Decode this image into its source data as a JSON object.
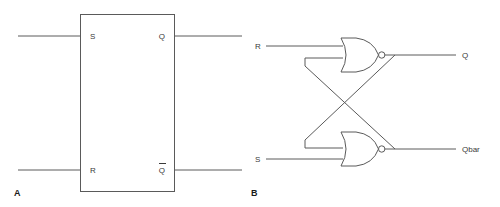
{
  "figure": {
    "stroke_color": "#5a5a5a",
    "text_color": "#3a3a3a",
    "background": "#ffffff"
  },
  "panel_a": {
    "label": "A",
    "caption": "SR latch block symbol",
    "block": {
      "x": 80,
      "y": 14,
      "width": 95,
      "height": 178
    },
    "pins": [
      {
        "name": "S",
        "label": "S",
        "side": "left",
        "y": 36,
        "overline": false
      },
      {
        "name": "Q",
        "label": "Q",
        "side": "right",
        "y": 36,
        "overline": false
      },
      {
        "name": "R",
        "label": "R",
        "side": "left",
        "y": 170,
        "overline": false
      },
      {
        "name": "Qbar",
        "label": "Q",
        "side": "right",
        "y": 170,
        "overline": true
      }
    ],
    "wires": [
      {
        "name": "s-input-wire",
        "x1": 18,
        "y1": 36,
        "x2": 80,
        "y2": 36
      },
      {
        "name": "q-output-wire",
        "x1": 175,
        "y1": 36,
        "x2": 242,
        "y2": 36
      },
      {
        "name": "r-input-wire",
        "x1": 18,
        "y1": 170,
        "x2": 80,
        "y2": 170
      },
      {
        "name": "qbar-output-wire",
        "x1": 175,
        "y1": 170,
        "x2": 242,
        "y2": 170
      }
    ]
  },
  "panel_b": {
    "label": "B",
    "caption": "Cross-coupled NOR gate implementation",
    "inputs": [
      {
        "name": "R",
        "label": "R",
        "label_x": 255,
        "label_y": 49,
        "wire_x1": 266,
        "wire_x2": 341,
        "wire_y": 46
      },
      {
        "name": "S",
        "label": "S",
        "label_x": 255,
        "label_y": 162,
        "wire_x1": 266,
        "wire_x2": 341,
        "wire_y": 159
      }
    ],
    "outputs": [
      {
        "name": "Q",
        "label": "Q",
        "label_x": 462,
        "label_y": 58,
        "wire_x1": 385,
        "wire_x2": 456,
        "wire_y": 55
      },
      {
        "name": "Qbar",
        "label": "Qbar",
        "label_x": 462,
        "label_y": 152,
        "wire_x1": 385,
        "wire_x2": 456,
        "wire_y": 149
      }
    ],
    "gates": [
      {
        "name": "nor-gate-top",
        "type": "NOR",
        "x": 341,
        "y_center": 55,
        "body_width": 37,
        "body_height": 34,
        "bubble_cx": 381,
        "bubble_r": 3.2
      },
      {
        "name": "nor-gate-bottom",
        "type": "NOR",
        "x": 341,
        "y_center": 149,
        "body_width": 37,
        "body_height": 34,
        "bubble_cx": 381,
        "bubble_r": 3.2
      }
    ],
    "feedback": [
      {
        "name": "feedback-q-to-bottom-gate",
        "description": "Top gate output Q routes down-left to bottom gate upper input"
      },
      {
        "name": "feedback-qbar-to-top-gate",
        "description": "Bottom gate output Qbar routes up-left to top gate lower input"
      }
    ]
  }
}
